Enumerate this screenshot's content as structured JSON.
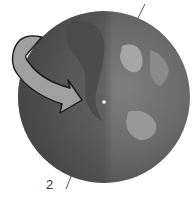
{
  "diagram": {
    "labels": [
      {
        "id": "axis-bottom-label",
        "text": "2"
      }
    ],
    "colors": {
      "globe_dark": "#4a4a4a",
      "globe_mid": "#6a6a6a",
      "globe_light": "#8c8c8c",
      "land_light": "#a8a8a8",
      "arrow_fill": "#a0a0a0",
      "arrow_stroke": "#1a1a1a",
      "axis_line": "#555555",
      "center_dot": "#ffffff"
    }
  }
}
